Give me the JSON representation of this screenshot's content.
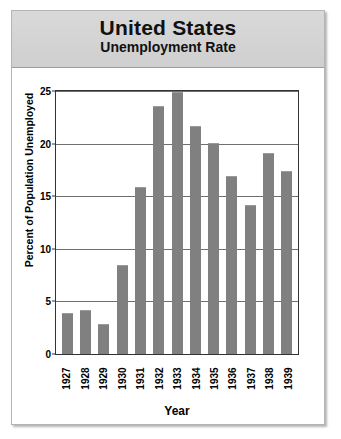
{
  "title": {
    "main": "United States",
    "sub": "Unemployment Rate"
  },
  "colors": {
    "bar": "#808080",
    "grid": "#6f6f6f",
    "axis": "#333333",
    "title_band": "#d4d4d4",
    "background": "#ffffff"
  },
  "chart_data": {
    "type": "bar",
    "title": "United States Unemployment Rate",
    "subtitle": "Unemployment Rate",
    "xlabel": "Year",
    "ylabel": "Percent of Population Unemployed",
    "categories": [
      "1927",
      "1928",
      "1929",
      "1930",
      "1931",
      "1932",
      "1933",
      "1934",
      "1935",
      "1936",
      "1937",
      "1938",
      "1939"
    ],
    "values": [
      3.9,
      4.2,
      2.9,
      8.5,
      15.9,
      23.6,
      24.9,
      21.7,
      20.1,
      16.9,
      14.2,
      19.1,
      17.4
    ],
    "ylim": [
      0,
      25
    ],
    "yticks": [
      0,
      5,
      10,
      15,
      20,
      25
    ],
    "ytick_labels": [
      "0",
      "5",
      "10",
      "15",
      "20",
      "25"
    ],
    "grid": true,
    "legend": "none",
    "orientation": "vertical"
  }
}
